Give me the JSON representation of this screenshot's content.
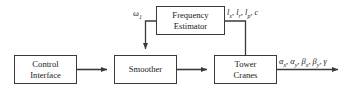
{
  "diagram": {
    "type": "block-diagram",
    "background_color": "#ffffff",
    "line_color": "#3a3a3a",
    "text_color": "#1a1a1a",
    "blocks": [
      {
        "id": "control-interface",
        "lines": [
          "Control",
          "Interface"
        ],
        "line1": "Control",
        "line2": "Interface",
        "x": 14,
        "y": 55,
        "w": 63,
        "h": 29
      },
      {
        "id": "smoother",
        "lines": [
          "Smoother"
        ],
        "line1": "Smoother",
        "line2": "",
        "x": 114,
        "y": 55,
        "w": 63,
        "h": 29
      },
      {
        "id": "tower-cranes",
        "lines": [
          "Tower",
          "Cranes"
        ],
        "line1": "Tower",
        "line2": "Cranes",
        "x": 214,
        "y": 55,
        "w": 63,
        "h": 29
      },
      {
        "id": "frequency-estimator",
        "lines": [
          "Frequency",
          "Estimator"
        ],
        "line1": "Frequency",
        "line2": "Estimator",
        "x": 156,
        "y": 6,
        "w": 69,
        "h": 29
      }
    ],
    "signals": {
      "omega": {
        "symbol": "ω",
        "subscript": "1",
        "full": "ω₁"
      },
      "lengths": {
        "full": "lₓ, lᵣ, lₚ, c",
        "items": [
          {
            "sym": "l",
            "sub": "x"
          },
          {
            "sym": "l",
            "sub": "r"
          },
          {
            "sym": "l",
            "sub": "p"
          },
          {
            "sym": "c",
            "sub": ""
          }
        ]
      },
      "outputs": {
        "full": "αₓ, αᵧ, βₓ, βᵧ, γ",
        "items": [
          {
            "sym": "α",
            "sub": "x"
          },
          {
            "sym": "α",
            "sub": "y"
          },
          {
            "sym": "β",
            "sub": "x"
          },
          {
            "sym": "β",
            "sub": "y"
          },
          {
            "sym": "γ",
            "sub": ""
          }
        ]
      }
    }
  }
}
